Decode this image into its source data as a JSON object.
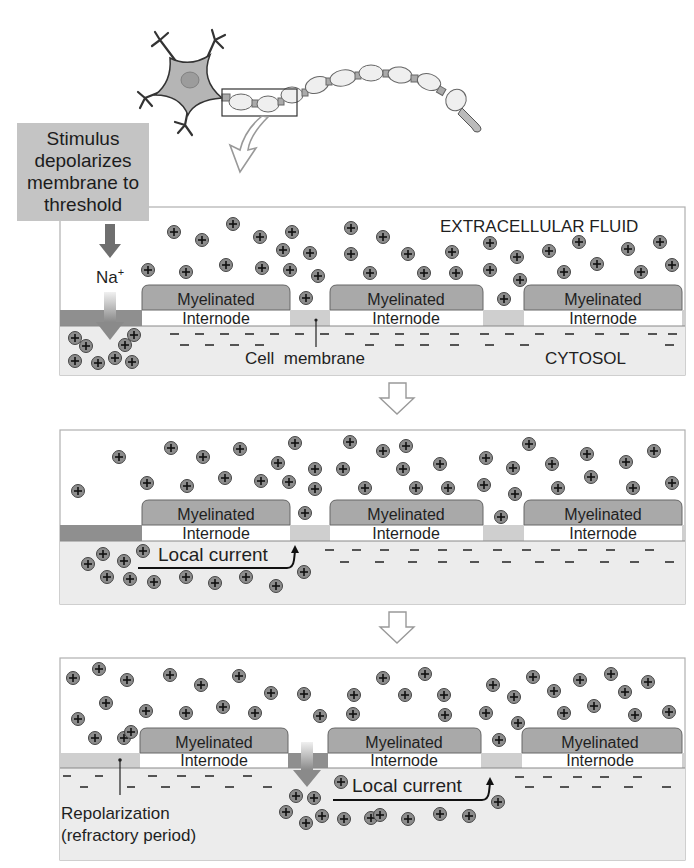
{
  "stimulus_box": {
    "lines": [
      "Stimulus",
      "depolarizes",
      "membrane to",
      "threshold"
    ]
  },
  "panel1": {
    "extracellular_label": "EXTRACELLULAR FLUID",
    "cytosol_label": "CYTOSOL",
    "ion_label": "Na",
    "ion_sup": "+",
    "cell_membrane_label": "Cell  membrane",
    "internodes": [
      {
        "line1": "Myelinated",
        "line2": "Internode"
      },
      {
        "line1": "Myelinated",
        "line2": "Internode"
      },
      {
        "line1": "Myelinated",
        "line2": "Internode"
      }
    ]
  },
  "panel2": {
    "local_current_label": "Local current",
    "internodes": [
      {
        "line1": "Myelinated",
        "line2": "Internode"
      },
      {
        "line1": "Myelinated",
        "line2": "Internode"
      },
      {
        "line1": "Myelinated",
        "line2": "Internode"
      }
    ]
  },
  "panel3": {
    "local_current_label": "Local current",
    "repolarization_label_1": "Repolarization",
    "repolarization_label_2": "(refractory period)",
    "internodes": [
      {
        "line1": "Myelinated",
        "line2": "Internode"
      },
      {
        "line1": "Myelinated",
        "line2": "Internode"
      },
      {
        "line1": "Myelinated",
        "line2": "Internode"
      }
    ]
  },
  "colors": {
    "myelin": "#a9a9a9",
    "cytosol": "#ececec",
    "active_node": "#8f8f8f",
    "resting_node": "#cfcfcf",
    "ion": "#8c8c8c",
    "stimulus_box": "#c4c4c4"
  },
  "icons": [
    "neuron-illustration",
    "zoom-region-box",
    "curved-arrow-icon",
    "down-arrow-icon",
    "hollow-down-arrow-icon",
    "positive-ion-icon",
    "negative-charge-icon"
  ]
}
